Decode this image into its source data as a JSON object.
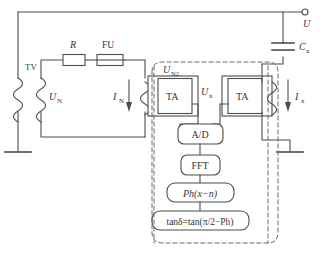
{
  "diagram": {
    "stroke_color": "#4d4d4d",
    "dash_color": "#6b6b6b",
    "background": "#ffffff"
  },
  "components": {
    "tv_transformer": "TV",
    "resistor": "R",
    "fuse": "FU",
    "ta_left": "TA",
    "ta_right": "TA",
    "capacitor": "C",
    "capacitor_sub": "x"
  },
  "signals": {
    "u_n": "U",
    "u_n_sub": "N",
    "i_n": "I",
    "i_n_sub": "N",
    "u_n2": "U",
    "u_n2_sub": "N2",
    "u_x": "U",
    "u_x_sub": "x",
    "i_x": "I",
    "i_x_sub": "x",
    "terminal_u": "U"
  },
  "processing_chain": [
    {
      "id": "adc",
      "label": "A/D"
    },
    {
      "id": "fft",
      "label": "FFT"
    },
    {
      "id": "phase",
      "label": "Ph(x−n)"
    },
    {
      "id": "tand",
      "label": "tanδ=tan(π/2−Ph)"
    }
  ]
}
